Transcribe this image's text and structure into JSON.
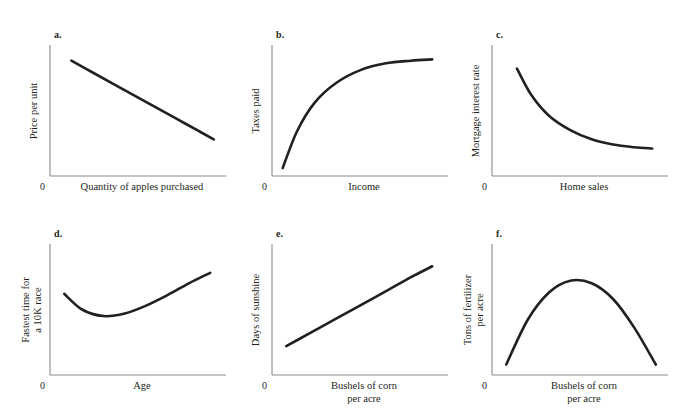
{
  "figure": {
    "caption": "",
    "axis_color": "#8a8a8a",
    "curve_color": "#231f20",
    "zero_label": "0"
  },
  "chart_data": [
    {
      "id": "a",
      "type": "line",
      "tag": "a.",
      "title": "",
      "xlabel": "Quantity of apples purchased",
      "ylabel": "Price per unit",
      "shape": "linear-decreasing",
      "grid": false,
      "legend": "none",
      "xlim": [
        0,
        100
      ],
      "ylim": [
        0,
        100
      ],
      "x": [
        12,
        24,
        36,
        48,
        60,
        72,
        84,
        92
      ],
      "y": [
        88,
        79,
        70,
        61,
        52,
        43,
        34,
        28
      ]
    },
    {
      "id": "b",
      "type": "line",
      "tag": "b.",
      "title": "",
      "xlabel": "Income",
      "ylabel": "Taxes paid",
      "shape": "concave-increasing",
      "grid": false,
      "legend": "none",
      "xlim": [
        0,
        100
      ],
      "ylim": [
        0,
        100
      ],
      "x": [
        6,
        14,
        24,
        36,
        50,
        64,
        78,
        90
      ],
      "y": [
        6,
        34,
        56,
        71,
        81,
        86,
        88,
        89
      ]
    },
    {
      "id": "c",
      "type": "line",
      "tag": "c.",
      "title": "",
      "xlabel": "Home sales",
      "ylabel": "Mortgage interest rate",
      "shape": "convex-decreasing",
      "grid": false,
      "legend": "none",
      "xlim": [
        0,
        100
      ],
      "ylim": [
        0,
        100
      ],
      "x": [
        14,
        22,
        32,
        44,
        56,
        68,
        80,
        90
      ],
      "y": [
        82,
        62,
        46,
        35,
        28,
        24,
        22,
        21
      ]
    },
    {
      "id": "d",
      "type": "line",
      "tag": "d.",
      "title": "",
      "xlabel": "Age",
      "ylabel": "Fastest time for\na 10K race",
      "shape": "u-shaped",
      "grid": false,
      "legend": "none",
      "xlim": [
        0,
        100
      ],
      "ylim": [
        0,
        100
      ],
      "x": [
        8,
        18,
        30,
        42,
        54,
        66,
        78,
        90
      ],
      "y": [
        62,
        50,
        45,
        47,
        53,
        61,
        70,
        78
      ]
    },
    {
      "id": "e",
      "type": "line",
      "tag": "e.",
      "title": "",
      "xlabel": "Bushels of corn\nper acre",
      "ylabel": "Days of sunshine",
      "shape": "linear-increasing",
      "grid": false,
      "legend": "none",
      "xlim": [
        0,
        100
      ],
      "ylim": [
        0,
        100
      ],
      "x": [
        8,
        20,
        32,
        44,
        56,
        68,
        80,
        90
      ],
      "y": [
        22,
        31,
        40,
        49,
        58,
        67,
        76,
        83
      ]
    },
    {
      "id": "f",
      "type": "line",
      "tag": "f.",
      "title": "",
      "xlabel": "Bushels of corn\nper acre",
      "ylabel": "Tons of fertilizer\nper acre",
      "shape": "inverted-u",
      "grid": false,
      "legend": "none",
      "xlim": [
        0,
        100
      ],
      "ylim": [
        0,
        100
      ],
      "x": [
        8,
        20,
        32,
        44,
        56,
        68,
        80,
        92
      ],
      "y": [
        8,
        42,
        63,
        72,
        70,
        58,
        36,
        8
      ]
    }
  ]
}
